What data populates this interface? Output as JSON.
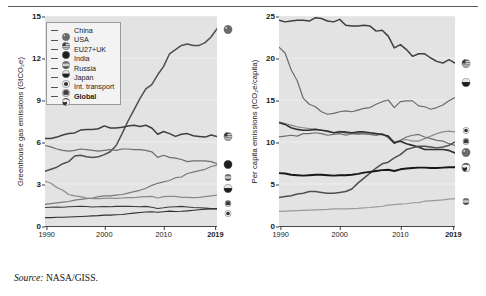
{
  "figure": {
    "source_prefix": "Source:",
    "source_text": "NASA/GISS."
  },
  "legend": {
    "items": [
      {
        "label": "China",
        "marker": "china-flag-marker",
        "bold": false
      },
      {
        "label": "USA",
        "marker": "usa-flag-marker",
        "bold": false
      },
      {
        "label": "EU27+UK",
        "marker": "eu-flag-marker",
        "bold": false
      },
      {
        "label": "India",
        "marker": "india-flag-marker",
        "bold": false
      },
      {
        "label": "Russia",
        "marker": "russia-flag-marker",
        "bold": false
      },
      {
        "label": "Japan",
        "marker": "japan-flag-marker",
        "bold": false
      },
      {
        "label": "Int. transport",
        "marker": "int-transport-marker",
        "bold": false
      },
      {
        "label": "Global",
        "marker": "global-globe-marker",
        "bold": true
      }
    ]
  },
  "chart_data": [
    {
      "id": "ghg-emissions",
      "type": "line",
      "title": "",
      "xlabel": "",
      "ylabel": "Greenhouse gas emissions (GtCO₂e)",
      "xlim": [
        1990,
        2019
      ],
      "ylim": [
        0,
        15
      ],
      "yticks": [
        0,
        3,
        6,
        9,
        12,
        15
      ],
      "xticks": [
        1990,
        2000,
        2010,
        2019
      ],
      "xtick_bold": [
        2019
      ],
      "grid": true,
      "legend_position": "inside-top-left",
      "x": [
        1990,
        1991,
        1992,
        1993,
        1994,
        1995,
        1996,
        1997,
        1998,
        1999,
        2000,
        2001,
        2002,
        2003,
        2004,
        2005,
        2006,
        2007,
        2008,
        2009,
        2010,
        2011,
        2012,
        2013,
        2014,
        2015,
        2016,
        2017,
        2018,
        2019
      ],
      "series": [
        {
          "name": "China",
          "color": "#4f4f4f",
          "width": 1.5,
          "values": [
            3.9,
            4.05,
            4.2,
            4.45,
            4.6,
            5.0,
            5.05,
            4.95,
            4.9,
            4.95,
            5.1,
            5.3,
            5.75,
            6.6,
            7.5,
            8.3,
            9.1,
            9.8,
            10.1,
            10.8,
            11.4,
            12.3,
            12.6,
            12.9,
            13.0,
            12.9,
            12.9,
            13.1,
            13.5,
            14.1
          ]
        },
        {
          "name": "USA",
          "color": "#3f3f3f",
          "width": 1.5,
          "values": [
            6.25,
            6.25,
            6.35,
            6.5,
            6.6,
            6.65,
            6.85,
            6.9,
            6.9,
            6.95,
            7.15,
            7.0,
            7.0,
            7.05,
            7.15,
            7.2,
            7.1,
            7.2,
            7.0,
            6.55,
            6.75,
            6.6,
            6.4,
            6.55,
            6.6,
            6.45,
            6.4,
            6.35,
            6.5,
            6.4
          ]
        },
        {
          "name": "EU27+UK",
          "color": "#6d6d6d",
          "width": 1.2,
          "values": [
            5.75,
            5.65,
            5.5,
            5.4,
            5.35,
            5.4,
            5.5,
            5.45,
            5.4,
            5.35,
            5.4,
            5.45,
            5.4,
            5.5,
            5.5,
            5.45,
            5.45,
            5.4,
            5.3,
            4.9,
            5.05,
            4.9,
            4.85,
            4.75,
            4.6,
            4.65,
            4.65,
            4.65,
            4.6,
            4.45
          ]
        },
        {
          "name": "India",
          "color": "#7a7a7a",
          "width": 1.2,
          "values": [
            1.55,
            1.6,
            1.65,
            1.7,
            1.75,
            1.85,
            1.9,
            1.95,
            2.0,
            2.1,
            2.15,
            2.15,
            2.2,
            2.25,
            2.35,
            2.45,
            2.55,
            2.7,
            2.9,
            3.05,
            3.15,
            3.25,
            3.45,
            3.5,
            3.75,
            3.85,
            3.95,
            4.05,
            4.25,
            4.35
          ]
        },
        {
          "name": "Russia",
          "color": "#8a8a8a",
          "width": 1.2,
          "values": [
            3.2,
            3.05,
            2.75,
            2.55,
            2.25,
            2.15,
            2.1,
            2.0,
            1.95,
            1.95,
            1.98,
            2.0,
            1.98,
            2.0,
            2.02,
            2.02,
            2.08,
            2.1,
            2.12,
            2.0,
            2.1,
            2.12,
            2.12,
            2.05,
            2.05,
            2.02,
            2.05,
            2.1,
            2.15,
            2.2
          ]
        },
        {
          "name": "Japan",
          "color": "#3a3a3a",
          "width": 1.1,
          "values": [
            1.32,
            1.34,
            1.35,
            1.34,
            1.38,
            1.39,
            1.4,
            1.39,
            1.36,
            1.38,
            1.39,
            1.37,
            1.4,
            1.4,
            1.4,
            1.39,
            1.38,
            1.4,
            1.34,
            1.25,
            1.3,
            1.36,
            1.38,
            1.4,
            1.36,
            1.32,
            1.3,
            1.28,
            1.24,
            1.21
          ]
        },
        {
          "name": "Int. transport",
          "color": "#2e2e2e",
          "width": 1.1,
          "values": [
            0.6,
            0.6,
            0.62,
            0.62,
            0.64,
            0.66,
            0.68,
            0.7,
            0.72,
            0.74,
            0.78,
            0.78,
            0.8,
            0.82,
            0.88,
            0.92,
            0.96,
            1.0,
            1.02,
            0.98,
            1.02,
            1.06,
            1.04,
            1.05,
            1.08,
            1.12,
            1.16,
            1.2,
            1.22,
            1.24
          ]
        },
        {
          "name": "Global",
          "color": "#111111",
          "width": 1.0,
          "values": [
            null
          ]
        }
      ],
      "end_markers": [
        {
          "name": "China",
          "value": 14.1,
          "marker": "china-flag-marker"
        },
        {
          "name": "USA",
          "value": 6.4,
          "marker": "usa-flag-marker"
        },
        {
          "name": "EU27+UK",
          "value": 4.45,
          "marker": "eu-flag-marker"
        },
        {
          "name": "India",
          "value": 3.6,
          "marker": "india-flag-marker"
        },
        {
          "name": "Russia",
          "value": 2.75,
          "marker": "russia-flag-marker"
        },
        {
          "name": "Int. transport",
          "value": 1.75,
          "marker": "int-transport-marker"
        },
        {
          "name": "Japan",
          "value": 1.0,
          "marker": "japan-flag-marker"
        }
      ]
    },
    {
      "id": "per-capita-emissions",
      "type": "line",
      "title": "",
      "xlabel": "",
      "ylabel": "Per capita emissions (tCO₂e/capita)",
      "xlim": [
        1990,
        2019
      ],
      "ylim": [
        0,
        25
      ],
      "yticks": [
        0,
        5,
        10,
        15,
        20,
        25
      ],
      "xticks": [
        1990,
        2000,
        2010,
        2019
      ],
      "xtick_bold": [
        2019
      ],
      "grid": true,
      "legend_position": "none",
      "x": [
        1990,
        1991,
        1992,
        1993,
        1994,
        1995,
        1996,
        1997,
        1998,
        1999,
        2000,
        2001,
        2002,
        2003,
        2004,
        2005,
        2006,
        2007,
        2008,
        2009,
        2010,
        2011,
        2012,
        2013,
        2014,
        2015,
        2016,
        2017,
        2018,
        2019
      ],
      "series": [
        {
          "name": "USA",
          "color": "#3f3f3f",
          "width": 1.5,
          "values": [
            24.5,
            24.3,
            24.4,
            24.5,
            24.5,
            24.4,
            24.8,
            24.7,
            24.4,
            24.3,
            24.6,
            23.9,
            23.8,
            23.8,
            23.9,
            23.8,
            23.2,
            23.3,
            22.6,
            21.2,
            21.6,
            21.0,
            20.2,
            20.5,
            20.5,
            20.0,
            19.6,
            19.4,
            19.8,
            19.4
          ]
        },
        {
          "name": "Russia",
          "color": "#6b6b6b",
          "width": 1.2,
          "values": [
            21.3,
            20.6,
            18.6,
            17.3,
            15.2,
            14.5,
            14.2,
            13.6,
            13.3,
            13.4,
            13.6,
            13.7,
            13.6,
            13.8,
            14.0,
            14.1,
            14.5,
            14.8,
            15.0,
            14.1,
            14.8,
            14.9,
            14.9,
            14.3,
            14.2,
            13.9,
            14.1,
            14.4,
            14.9,
            15.3
          ]
        },
        {
          "name": "Int. transport",
          "color": "#8d8d8d",
          "width": 1.2,
          "values": [
            12.4,
            12.2,
            12.0,
            11.8,
            11.7,
            11.6,
            11.5,
            11.4,
            11.2,
            11.1,
            11.3,
            11.0,
            11.0,
            10.9,
            11.0,
            10.9,
            10.8,
            10.9,
            10.6,
            10.0,
            10.2,
            10.3,
            10.1,
            10.1,
            10.4,
            10.7,
            11.0,
            11.2,
            11.3,
            11.2
          ]
        },
        {
          "name": "Japan",
          "color": "#6f6f6f",
          "width": 1.2,
          "values": [
            10.6,
            10.7,
            10.8,
            10.7,
            11.0,
            11.0,
            11.1,
            11.0,
            10.8,
            10.9,
            11.0,
            10.8,
            11.0,
            11.0,
            11.0,
            10.9,
            10.8,
            11.0,
            10.5,
            9.8,
            10.2,
            10.6,
            10.8,
            10.9,
            10.6,
            10.4,
            10.2,
            10.1,
            9.8,
            9.6
          ]
        },
        {
          "name": "EU27+UK",
          "color": "#2f2f2f",
          "width": 1.6,
          "values": [
            12.3,
            12.1,
            11.7,
            11.5,
            11.4,
            11.4,
            11.5,
            11.4,
            11.3,
            11.1,
            11.2,
            11.2,
            11.1,
            11.2,
            11.2,
            11.1,
            11.0,
            10.9,
            10.7,
            9.9,
            10.1,
            9.8,
            9.6,
            9.4,
            9.1,
            9.1,
            9.1,
            9.1,
            9.0,
            8.7
          ]
        },
        {
          "name": "China",
          "color": "#4f4f4f",
          "width": 1.5,
          "values": [
            3.4,
            3.5,
            3.6,
            3.8,
            3.9,
            4.1,
            4.1,
            4.0,
            3.9,
            3.9,
            4.0,
            4.1,
            4.4,
            5.1,
            5.7,
            6.3,
            6.9,
            7.4,
            7.6,
            8.1,
            8.5,
            9.1,
            9.3,
            9.5,
            9.5,
            9.4,
            9.3,
            9.4,
            9.6,
            10.0
          ]
        },
        {
          "name": "Global",
          "color": "#171717",
          "width": 1.9,
          "values": [
            6.3,
            6.25,
            6.1,
            6.05,
            6.0,
            6.05,
            6.1,
            6.1,
            6.05,
            6.0,
            6.05,
            6.05,
            6.1,
            6.2,
            6.35,
            6.45,
            6.55,
            6.65,
            6.7,
            6.55,
            6.75,
            6.85,
            6.9,
            6.95,
            6.95,
            6.9,
            6.9,
            6.95,
            7.0,
            7.0
          ]
        },
        {
          "name": "India",
          "color": "#9a9a9a",
          "width": 1.2,
          "values": [
            1.75,
            1.78,
            1.8,
            1.83,
            1.86,
            1.9,
            1.93,
            1.96,
            1.98,
            2.03,
            2.05,
            2.05,
            2.08,
            2.1,
            2.15,
            2.2,
            2.27,
            2.35,
            2.48,
            2.55,
            2.6,
            2.65,
            2.77,
            2.78,
            2.95,
            3.0,
            3.05,
            3.1,
            3.2,
            3.25
          ]
        }
      ],
      "end_markers": [
        {
          "name": "USA",
          "value": 19.4,
          "marker": "usa-flag-marker"
        },
        {
          "name": "Russia",
          "value": 17.2,
          "marker": "russia-flag-marker"
        },
        {
          "name": "Japan",
          "value": 11.6,
          "marker": "japan-flag-marker"
        },
        {
          "name": "Int. transport",
          "value": 10.2,
          "marker": "int-transport-marker"
        },
        {
          "name": "China",
          "value": 8.8,
          "marker": "china-flag-marker"
        },
        {
          "name": "EU27+UK",
          "value": 7.0,
          "marker": "eu-flag-marker"
        },
        {
          "name": "Global",
          "value": 7.0,
          "marker": "global-globe-marker"
        },
        {
          "name": "India",
          "value": 3.1,
          "marker": "india-flag-marker"
        }
      ]
    }
  ],
  "colors": {
    "plot_background": "#e3e3e3",
    "axis": "#4a4a4a",
    "legend_background": "#f3f3f3",
    "text": "#1a1a1a"
  }
}
